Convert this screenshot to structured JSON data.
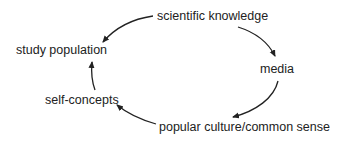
{
  "diagram": {
    "type": "cycle",
    "nodes": [
      {
        "id": "scientific-knowledge",
        "label": "scientific knowledge"
      },
      {
        "id": "media",
        "label": "media"
      },
      {
        "id": "popular-culture",
        "label": "popular culture/common sense"
      },
      {
        "id": "self-concepts",
        "label": "self-concepts"
      },
      {
        "id": "study-population",
        "label": "study population"
      }
    ],
    "edges": [
      {
        "from": "scientific-knowledge",
        "to": "study-population"
      },
      {
        "from": "scientific-knowledge",
        "to": "media"
      },
      {
        "from": "media",
        "to": "popular-culture"
      },
      {
        "from": "popular-culture",
        "to": "self-concepts"
      },
      {
        "from": "self-concepts",
        "to": "study-population"
      }
    ],
    "colors": {
      "text": "#222222",
      "arrow": "#222222",
      "background": "#ffffff"
    }
  }
}
